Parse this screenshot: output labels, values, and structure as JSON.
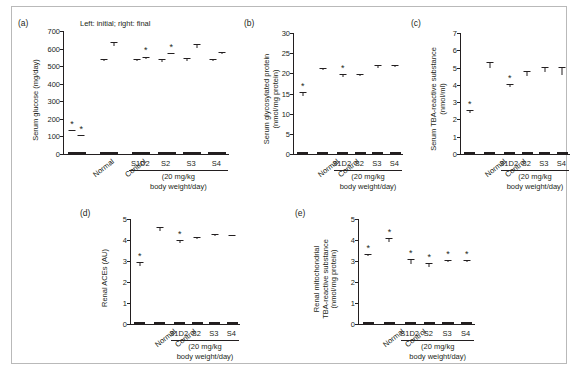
{
  "figure": {
    "panel_title_a": "Left: initial; right: final",
    "group_caption_line1": "(20 mg/kg",
    "group_caption_line2": "body weight/day)",
    "significance_marker": "*"
  },
  "chart_data": [
    {
      "type": "bar",
      "panel": "(a)",
      "title": "Left: initial; right: final",
      "ylabel": "Serum glucose (mg/day)",
      "xlabel": "",
      "ylim": [
        0,
        700
      ],
      "yticks": [
        0,
        100,
        200,
        300,
        400,
        500,
        600,
        700
      ],
      "grid": false,
      "paired": true,
      "series": [
        {
          "name": "initial",
          "values": [
            133,
            528,
            528,
            526,
            528,
            527
          ]
        },
        {
          "name": "final",
          "values": [
            100,
            615,
            541,
            568,
            603,
            572
          ]
        }
      ],
      "errors": [
        {
          "name": "initial",
          "values": [
            6,
            12,
            15,
            14,
            16,
            16
          ]
        },
        {
          "name": "final",
          "values": [
            7,
            20,
            14,
            9,
            22,
            10
          ]
        }
      ],
      "categories": [
        "Normal",
        "Control",
        "S1D2",
        "S2",
        "S3",
        "S4"
      ],
      "significance": [
        {
          "category": "Normal",
          "bar": "initial",
          "marker": "*"
        },
        {
          "category": "Normal",
          "bar": "final",
          "marker": "*"
        },
        {
          "category": "S1D2",
          "bar": "final",
          "marker": "*"
        },
        {
          "category": "S2",
          "bar": "final",
          "marker": "*"
        }
      ]
    },
    {
      "type": "bar",
      "panel": "(b)",
      "title": "",
      "ylabel": "Serum glycosylated protein (nmol/mg protein)",
      "xlabel": "",
      "ylim": [
        0,
        30
      ],
      "yticks": [
        0,
        5,
        10,
        15,
        20,
        25,
        30
      ],
      "grid": false,
      "categories": [
        "Normal",
        "Control",
        "S1D2",
        "S2",
        "S3",
        "S4"
      ],
      "values": [
        14.5,
        20.8,
        19.2,
        19.4,
        21.4,
        21.6
      ],
      "errors": [
        0.8,
        0.5,
        0.6,
        0.5,
        0.7,
        0.4
      ],
      "significance": [
        {
          "category": "Normal",
          "marker": "*"
        },
        {
          "category": "S1D2",
          "marker": "*"
        }
      ]
    },
    {
      "type": "bar",
      "panel": "(c)",
      "title": "",
      "ylabel": "Serum TBA-reactive substance (nmol/ml)",
      "xlabel": "",
      "ylim": [
        0,
        7
      ],
      "yticks": [
        0,
        1,
        2,
        3,
        4,
        5,
        6,
        7
      ],
      "grid": false,
      "categories": [
        "Normal",
        "Control",
        "S1D2",
        "S2",
        "S3",
        "S4"
      ],
      "values": [
        2.35,
        5.0,
        3.9,
        4.5,
        4.75,
        4.6
      ],
      "errors": [
        0.2,
        0.35,
        0.15,
        0.3,
        0.3,
        0.45
      ],
      "significance": [
        {
          "category": "Normal",
          "marker": "*"
        },
        {
          "category": "S1D2",
          "marker": "*"
        }
      ]
    },
    {
      "type": "bar",
      "panel": "(d)",
      "title": "",
      "ylabel": "Renal ACEs (AU)",
      "xlabel": "",
      "ylim": [
        0,
        5
      ],
      "yticks": [
        0,
        1,
        2,
        3,
        4,
        5
      ],
      "grid": false,
      "categories": [
        "Normal",
        "Control",
        "S1D2",
        "S2",
        "S3",
        "S4"
      ],
      "values": [
        2.77,
        4.45,
        3.88,
        4.05,
        4.2,
        4.17
      ],
      "errors": [
        0.18,
        0.17,
        0.12,
        0.08,
        0.1,
        0.08
      ],
      "significance": [
        {
          "category": "Normal",
          "marker": "*"
        },
        {
          "category": "S1D2",
          "marker": "*"
        }
      ]
    },
    {
      "type": "bar",
      "panel": "(e)",
      "title": "",
      "ylabel": "Renal mitochondrial TBA-reactive substance (nmol/mg protein)",
      "xlabel": "",
      "ylim": [
        0,
        5
      ],
      "yticks": [
        0,
        1,
        2,
        3,
        4,
        5
      ],
      "grid": false,
      "categories": [
        "Normal",
        "Control",
        "S1D2",
        "S2",
        "S3",
        "S4"
      ],
      "values": [
        3.25,
        3.9,
        2.88,
        2.7,
        2.95,
        2.97
      ],
      "errors": [
        0.1,
        0.2,
        0.22,
        0.2,
        0.1,
        0.1
      ],
      "significance": [
        {
          "category": "Normal",
          "marker": "*"
        },
        {
          "category": "Control",
          "marker": "*"
        },
        {
          "category": "S1D2",
          "marker": "*"
        },
        {
          "category": "S2",
          "marker": "*"
        },
        {
          "category": "S3",
          "marker": "*"
        },
        {
          "category": "S4",
          "marker": "*"
        }
      ]
    }
  ],
  "panels": {
    "a": {
      "tag": "(a)",
      "ylabel": "Serum glucose (mg/day)"
    },
    "b": {
      "tag": "(b)",
      "ylabel_l1": "Serum glycosylated protein",
      "ylabel_l2": "(nmol/mg protein)"
    },
    "c": {
      "tag": "(c)",
      "ylabel_l1": "Serum TBA-reactive substance",
      "ylabel_l2": "(nmol/ml)"
    },
    "d": {
      "tag": "(d)",
      "ylabel": "Renal ACEs (AU)"
    },
    "e": {
      "tag": "(e)",
      "ylabel_l1": "Renal mitochondrial",
      "ylabel_l2": "TBA-reactive substance",
      "ylabel_l3": "(nmol/mg protein)"
    }
  }
}
